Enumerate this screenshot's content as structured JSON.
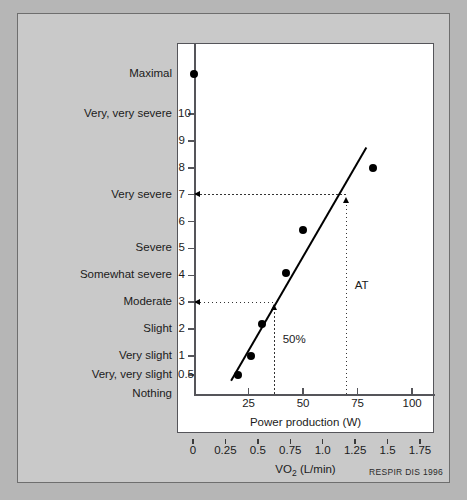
{
  "credit": "RESPIR DIS 1996",
  "chart_data": {
    "type": "scatter",
    "title": "",
    "xlabel": "Power production (W)",
    "ylabel": "",
    "secondary_xlabel": "VO2 (L/min)",
    "secondary_xlabel_main": "VO",
    "secondary_xlabel_sub": "2",
    "secondary_xlabel_unit": " (L/min)",
    "xlim": [
      0,
      110
    ],
    "ylim": [
      0,
      11.8
    ],
    "grid": false,
    "legend": "none",
    "xticks": [
      25,
      50,
      75,
      100
    ],
    "xticklabels": [
      "25",
      "50",
      "75",
      "100"
    ],
    "secondary_xticks": [
      0,
      0.25,
      0.5,
      0.75,
      1.0,
      1.25,
      1.5,
      1.75
    ],
    "secondary_xticklabels": [
      "0",
      "0.25",
      "0.5",
      "0.75",
      "1.0",
      "1.25",
      "1.5",
      "1.75"
    ],
    "yticks": [
      0.5,
      1,
      2,
      3,
      4,
      5,
      6,
      7,
      8,
      9,
      10
    ],
    "yticklabels": [
      "0.5",
      "1",
      "2",
      "3",
      "4",
      "5",
      "6",
      "7",
      "8",
      "9",
      "10"
    ],
    "y_category_labels": [
      {
        "value": 11.5,
        "label": "Maximal"
      },
      {
        "value": 10,
        "label": "Very, very severe"
      },
      {
        "value": 9,
        "label": ""
      },
      {
        "value": 8,
        "label": ""
      },
      {
        "value": 7,
        "label": "Very severe"
      },
      {
        "value": 6,
        "label": ""
      },
      {
        "value": 5,
        "label": "Severe"
      },
      {
        "value": 4,
        "label": "Somewhat severe"
      },
      {
        "value": 3,
        "label": "Moderate"
      },
      {
        "value": 2,
        "label": "Slight"
      },
      {
        "value": 1,
        "label": "Very slight"
      },
      {
        "value": 0.5,
        "label": "Very, very slight"
      },
      {
        "value": 0,
        "label": "Nothing"
      }
    ],
    "points": [
      {
        "x": 0,
        "y": 11.5,
        "note": "Maximal"
      },
      {
        "x": 20,
        "y": 0.5
      },
      {
        "x": 26,
        "y": 1.0
      },
      {
        "x": 31,
        "y": 2.2
      },
      {
        "x": 42,
        "y": 4.1
      },
      {
        "x": 50,
        "y": 5.7
      },
      {
        "x": 82,
        "y": 8.0
      }
    ],
    "fit_line": {
      "x1": 17,
      "y1": 0.35,
      "x2": 79,
      "y2": 8.75
    },
    "annotations": [
      {
        "label": "AT",
        "x": 70,
        "y_target": 7,
        "type": "vertical-dotted-arrow"
      },
      {
        "label": "50%",
        "x": 37,
        "y_target": 3,
        "type": "vertical-dotted-arrow"
      }
    ],
    "reference_lines": [
      {
        "from_y": 7,
        "to_x": 70,
        "type": "horizontal-dotted-arrow"
      },
      {
        "from_y": 3,
        "to_x": 37,
        "type": "horizontal-dotted-arrow"
      }
    ]
  }
}
